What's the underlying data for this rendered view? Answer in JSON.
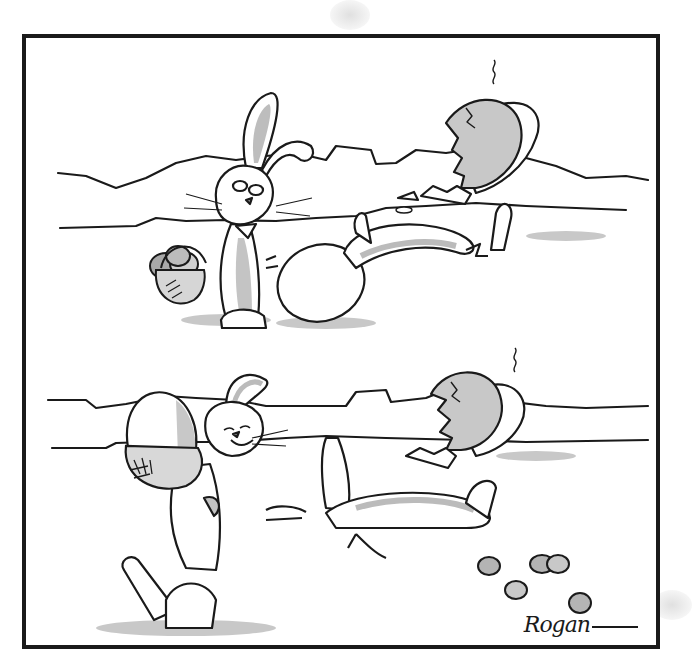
{
  "comic": {
    "panel_count": 1,
    "scene_count": 2,
    "signature": "Rogan",
    "caption": "",
    "colors": {
      "ink": "#1a1a1a",
      "shade": "#b8b8b8",
      "light_shade": "#d9d9d9",
      "paper": "#ffffff"
    },
    "scenes": [
      {
        "id": "top",
        "description": "Easter bunny holding a basket of eggs looks down wearily at a chick that has hatched from a shell and lies on its back beside a large egg"
      },
      {
        "id": "bottom",
        "description": "Bunny carries the big egg away in a basket, grinning, while the chick lies sprawled on the ground with its eggshell hat, small eggs scattered nearby"
      }
    ]
  }
}
